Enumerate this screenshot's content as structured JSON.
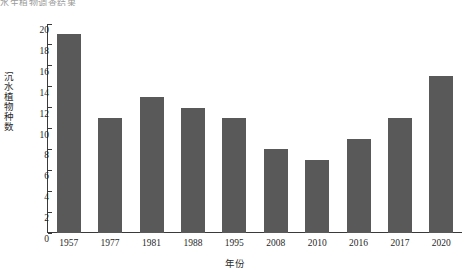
{
  "top_fragment": "水生植物调查结果",
  "chart_data": {
    "type": "bar",
    "title": "",
    "xlabel": "年份",
    "ylabel": "沉水植物种数",
    "categories": [
      "1957",
      "1977",
      "1981",
      "1988",
      "1995",
      "2008",
      "2010",
      "2016",
      "2017",
      "2020"
    ],
    "values": [
      19,
      11,
      13,
      12,
      11,
      8,
      7,
      9,
      11,
      15
    ],
    "ylim": [
      0,
      20
    ],
    "yticks": [
      20,
      18,
      16,
      14,
      12,
      10,
      8,
      6,
      4,
      2,
      0
    ],
    "grid": false,
    "legend": false,
    "bar_color": "#595959",
    "axis_color": "#3a3a3a",
    "text_color": "#1f1f1f"
  }
}
